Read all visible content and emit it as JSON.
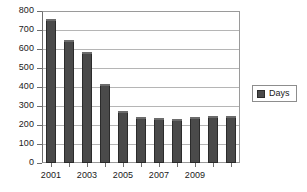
{
  "chart_data": {
    "type": "bar",
    "title": "",
    "subtitle": "",
    "xlabel": "",
    "ylabel": "",
    "categories": [
      "2001",
      "2002",
      "2003",
      "2004",
      "2005",
      "2006",
      "2007",
      "2008",
      "2009",
      "2010",
      "2011"
    ],
    "values": [
      760,
      650,
      585,
      415,
      275,
      240,
      235,
      230,
      240,
      245,
      245
    ],
    "series": [
      {
        "name": "Days",
        "values": [
          760,
          650,
          585,
          415,
          275,
          240,
          235,
          230,
          240,
          245,
          245
        ],
        "color": "#4a4a4a"
      }
    ],
    "ylim": [
      0,
      800
    ],
    "ytick_values": [
      0,
      100,
      200,
      300,
      400,
      500,
      600,
      700,
      800
    ],
    "ytick_labels": [
      "0",
      "100",
      "200",
      "300",
      "400",
      "500",
      "600",
      "700",
      "800"
    ],
    "xtick_labels_shown": [
      "2001",
      "",
      "2003",
      "",
      "2005",
      "",
      "2007",
      "",
      "2009",
      "",
      ""
    ],
    "grid": "horizontal",
    "legend": {
      "position": "right",
      "entries": [
        {
          "label": "Days",
          "swatch_name": "legend-swatch-days",
          "color": "#4a4a4a"
        }
      ]
    },
    "plot_background": "#ffffff",
    "grid_color": "#b5b5b5",
    "axis_color": "#6e6e6e",
    "text_color": "#1a1a1a"
  }
}
